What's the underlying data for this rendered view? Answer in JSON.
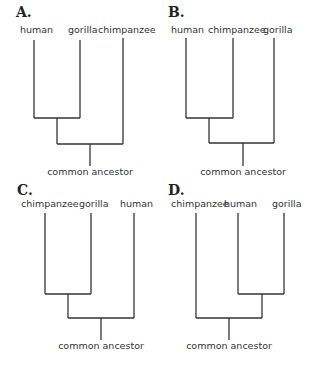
{
  "panels": [
    {
      "id": "A",
      "label": "A.",
      "taxa": [
        "human",
        "gorilla",
        "chimpanzee"
      ],
      "root_label": "common ancestor",
      "topology": "((human,gorilla),chimpanzee)"
    },
    {
      "id": "B",
      "label": "B.",
      "taxa": [
        "human",
        "chimpanzee",
        "gorilla"
      ],
      "root_label": "common ancestor",
      "topology": "((human,chimpanzee),gorilla)"
    },
    {
      "id": "C",
      "label": "C.",
      "taxa": [
        "chimpanzee",
        "gorilla",
        "human"
      ],
      "root_label": "common ancestor",
      "topology": "((chimpanzee,gorilla),human)"
    },
    {
      "id": "D",
      "label": "D.",
      "taxa": [
        "chimpanzee",
        "human",
        "gorilla"
      ],
      "root_label": "common ancestor",
      "topology": "(chimpanzee,(human,gorilla))"
    }
  ]
}
